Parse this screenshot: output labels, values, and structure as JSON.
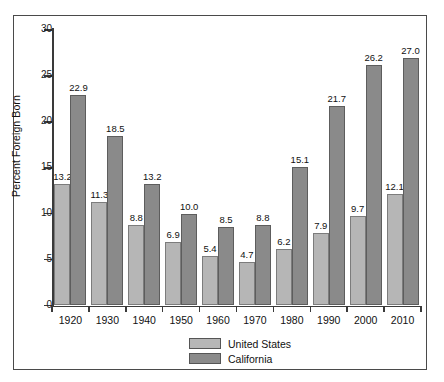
{
  "chart_data": {
    "type": "bar",
    "title": "",
    "subtitle": "",
    "xlabel": "",
    "ylabel": "Percent Foreign Born",
    "ylim": [
      0,
      30
    ],
    "yticks": [
      0,
      5,
      10,
      15,
      20,
      25,
      30
    ],
    "ytick_labels": [
      "0",
      "5",
      "10",
      "15",
      "20",
      "25",
      "30"
    ],
    "grid": false,
    "legend_position": "bottom-center",
    "categories": [
      "1920",
      "1930",
      "1940",
      "1950",
      "1960",
      "1970",
      "1980",
      "1990",
      "2000",
      "2010"
    ],
    "series": [
      {
        "name": "United States",
        "color": "#b6b6b6",
        "values": [
          13.2,
          11.3,
          8.8,
          6.9,
          5.4,
          4.7,
          6.2,
          7.9,
          9.7,
          12.1
        ],
        "labels": [
          "13.2",
          "11.3",
          "8.8",
          "6.9",
          "5.4",
          "4.7",
          "6.2",
          "7.9",
          "9.7",
          "12.1"
        ]
      },
      {
        "name": "California",
        "color": "#8a8a8a",
        "values": [
          22.9,
          18.5,
          13.2,
          10.0,
          8.5,
          8.8,
          15.1,
          21.7,
          26.2,
          27.0
        ],
        "labels": [
          "22.9",
          "18.5",
          "13.2",
          "10.0",
          "8.5",
          "8.8",
          "15.1",
          "21.7",
          "26.2",
          "27.0"
        ]
      }
    ],
    "legend": [
      {
        "label": "United States",
        "color": "#b6b6b6"
      },
      {
        "label": "California",
        "color": "#8a8a8a"
      }
    ]
  }
}
